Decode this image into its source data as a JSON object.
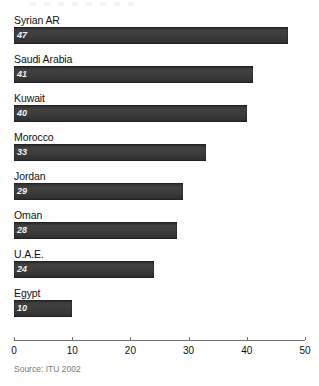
{
  "chart_data": {
    "type": "bar",
    "orientation": "horizontal",
    "title": "",
    "xlabel": "",
    "ylabel": "",
    "xlim": [
      0,
      50
    ],
    "grid": false,
    "legend": null,
    "categories": [
      "Syrian AR",
      "Saudi Arabia",
      "Kuwait",
      "Morocco",
      "Jordan",
      "Oman",
      "U.A.E.",
      "Egypt"
    ],
    "values": [
      47,
      41,
      40,
      33,
      29,
      28,
      24,
      10
    ],
    "value_labels": [
      "47",
      "41",
      "40",
      "33",
      "29",
      "28",
      "24",
      "10"
    ],
    "xticks": [
      0,
      10,
      20,
      30,
      40,
      50
    ],
    "xtick_labels": [
      "0",
      "10",
      "20",
      "30",
      "40",
      "50"
    ],
    "bars": [
      {
        "label": "Syrian AR",
        "value": 47,
        "value_label": "47"
      },
      {
        "label": "Saudi Arabia",
        "value": 41,
        "value_label": "41"
      },
      {
        "label": "Kuwait",
        "value": 40,
        "value_label": "40"
      },
      {
        "label": "Morocco",
        "value": 33,
        "value_label": "33"
      },
      {
        "label": "Jordan",
        "value": 29,
        "value_label": "29"
      },
      {
        "label": "Oman",
        "value": 28,
        "value_label": "28"
      },
      {
        "label": "U.A.E.",
        "value": 24,
        "value_label": "24"
      },
      {
        "label": "Egypt",
        "value": 10,
        "value_label": "10"
      }
    ]
  },
  "footer": {
    "source": "Source: ITU 2002"
  },
  "colors": {
    "bar": "#3a3a3a",
    "bar_top": "#2b2b2b",
    "value_text": "#f2f2f2",
    "label_text": "#111111",
    "axis": "#6d6d6d",
    "source_text": "#7a7a7a",
    "background": "#ffffff"
  }
}
